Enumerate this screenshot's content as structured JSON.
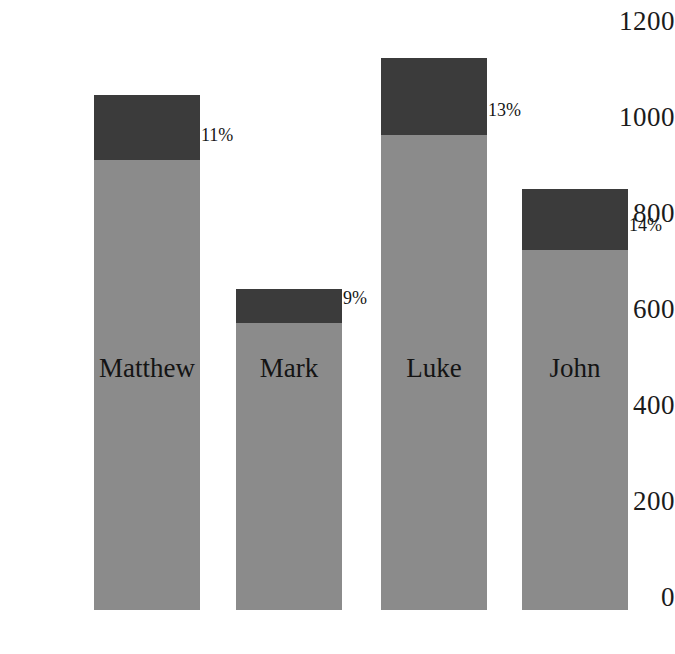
{
  "chart_data": {
    "type": "bar",
    "subtype": "stacked-bar",
    "title": "",
    "subtitle": "",
    "xlabel": "",
    "ylabel": "",
    "categories": [
      "Matthew",
      "Mark",
      "Luke",
      "John"
    ],
    "series": [
      {
        "name": "lower-segment",
        "color": "#8b8b8b",
        "values": [
          938,
          598,
          990,
          750
        ]
      },
      {
        "name": "upper-segment",
        "color": "#3b3b3b",
        "values": [
          135,
          71,
          160,
          127
        ]
      }
    ],
    "totals": [
      1073,
      669,
      1150,
      877
    ],
    "annotations": [
      "11%",
      "9%",
      "13%",
      "14%"
    ],
    "yticks": [
      1200,
      1000,
      800,
      600,
      400,
      200,
      0
    ],
    "ylim": [
      0,
      1200
    ],
    "grid": false,
    "legend": "none",
    "axis_line": "none"
  },
  "axis": {
    "ticks": [
      {
        "label": "1200",
        "value": 1200
      },
      {
        "label": "1000",
        "value": 1000
      },
      {
        "label": "800",
        "value": 800
      },
      {
        "label": "600",
        "value": 600
      },
      {
        "label": "400",
        "value": 400
      },
      {
        "label": "200",
        "value": 200
      },
      {
        "label": "0",
        "value": 0
      }
    ]
  },
  "bars": [
    {
      "name": "Matthew",
      "total": 1073,
      "lower": 938,
      "upper": 135,
      "percent_label": "11%",
      "colors": {
        "lower": "#8b8b8b",
        "upper": "#3b3b3b"
      }
    },
    {
      "name": "Mark",
      "total": 669,
      "lower": 598,
      "upper": 71,
      "percent_label": "9%",
      "colors": {
        "lower": "#8b8b8b",
        "upper": "#3b3b3b"
      }
    },
    {
      "name": "Luke",
      "total": 1150,
      "lower": 990,
      "upper": 160,
      "percent_label": "13%",
      "colors": {
        "lower": "#8b8b8b",
        "upper": "#3b3b3b"
      }
    },
    {
      "name": "John",
      "total": 877,
      "lower": 750,
      "upper": 127,
      "percent_label": "14%",
      "colors": {
        "lower": "#8b8b8b",
        "upper": "#3b3b3b"
      }
    }
  ],
  "layout": {
    "background": "#ffffff",
    "baseline_y": 610,
    "top_y": 21,
    "px_per_unit": 0.48,
    "bar_left_x": [
      94,
      236,
      381,
      522
    ],
    "bar_width": 106,
    "label_center_y": 368
  }
}
